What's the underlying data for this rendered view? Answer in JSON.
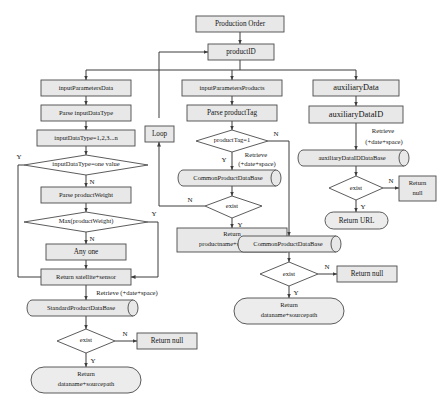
{
  "diagram": {
    "type": "flowchart",
    "colors": {
      "node_fill": "#e8e8e8",
      "diamond_fill": "#ffffff",
      "stroke": "#4a4a4a",
      "edge": "#3d3d3d",
      "text": "#141414",
      "background": "#ffffff"
    },
    "nodes": {
      "production_order": "Production Order",
      "product_id": "productID",
      "input_parameters_data": "inputParametersData",
      "parse_input_data_type": "Parse inputDataType",
      "input_data_type_enum": "inputDataType=1,2,3...n",
      "input_data_type_one_value": "inputDataType=one value",
      "parse_product_weight": "Parse productWeight",
      "max_product_weight": "Max(productWeight)",
      "any_one": "Any one",
      "return_satellite_sensor": "Return satellite+sensor",
      "standard_product_database": "StandardProductDataBase",
      "exist_left": "exist",
      "return_null_left": "Return null",
      "return_dataname_left_line1": "Return",
      "return_dataname_left_line2": "dataname+sourcepath",
      "input_parameters_products": "inputParametersProducts",
      "parse_product_tag": "Parse productTag",
      "loop": "Loop",
      "product_tag_eq_1": "productTag=1",
      "common_product_database_mid": "CommonProductDataBase",
      "exist_mid": "exist",
      "return_productname_line1": "Return",
      "return_productname_line2": "productname+sourcepath",
      "auxiliary_data": "auxiliaryData",
      "auxiliary_data_id": "auxiliaryDataID",
      "auxiliary_data_id_database": "auxiliaryDataIDDataBase",
      "exist_aux": "exist",
      "return_null_aux_line1": "Return",
      "return_null_aux_line2": "null",
      "return_url": "Return URL",
      "common_product_database_right": "CommonProductDataBase",
      "exist_right": "exist",
      "return_null_right": "Return null",
      "return_dataname_right_line1": "Return",
      "return_dataname_right_line2": "dataname+sourcepath"
    },
    "edge_labels": {
      "yes": "Y",
      "no": "N",
      "retrieve": "Retrieve",
      "retrieve_params": "(+date+space)",
      "retrieve_inline": "Retrieve (+date+space)"
    }
  }
}
